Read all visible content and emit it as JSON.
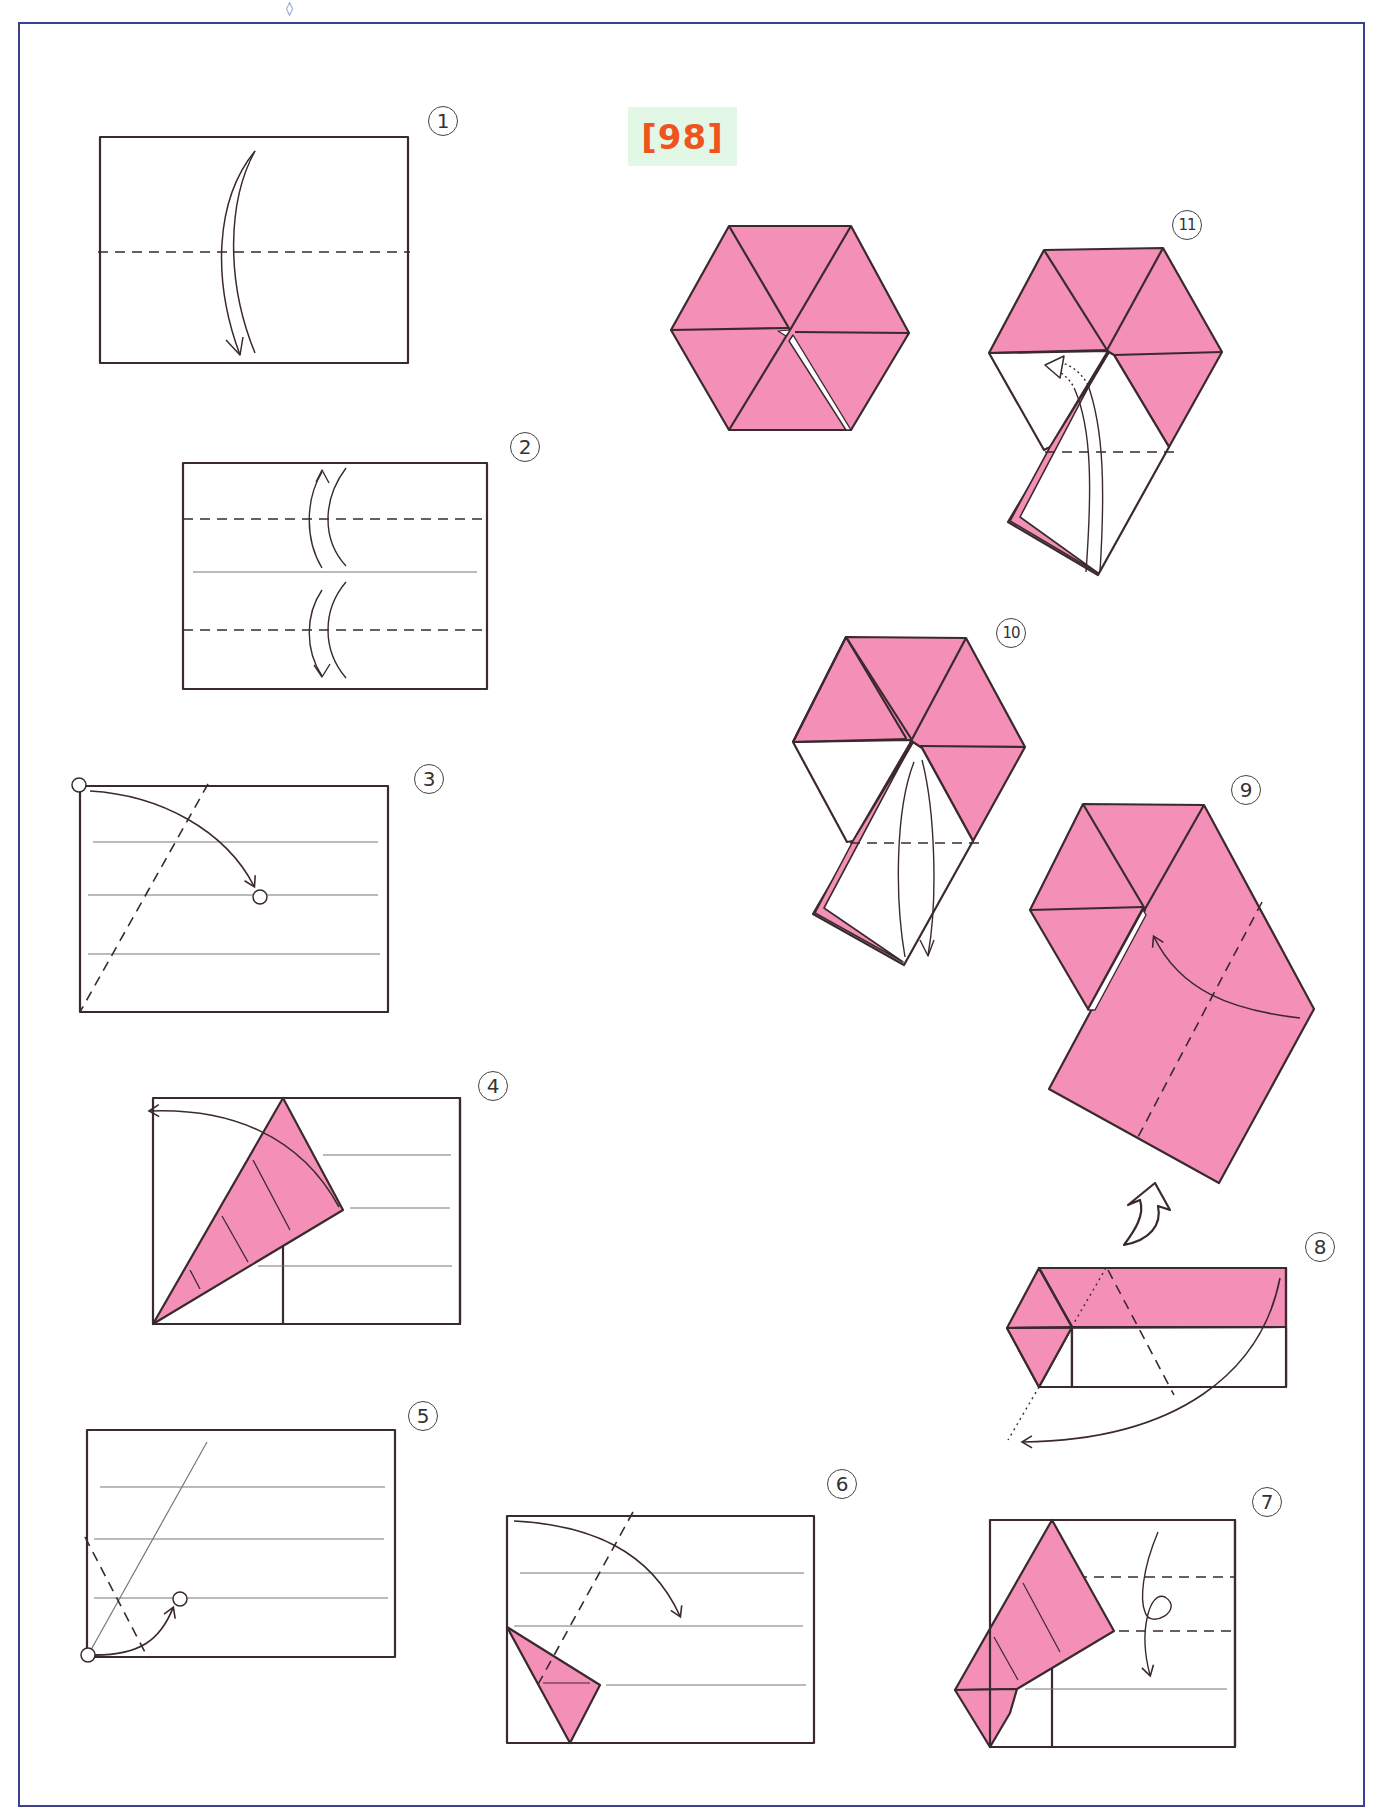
{
  "page": {
    "header_fragment": "y          g  p",
    "badge_label": "[98]",
    "colors": {
      "paper_pink": "#f48fb8",
      "line": "#3a2a2e",
      "frame_border": "#3d3f8f",
      "badge_bg": "#e3f7e6",
      "badge_text": "#f0541e"
    }
  },
  "steps": [
    {
      "number": "1",
      "label": "①",
      "description": "Valley fold rectangle in half horizontally"
    },
    {
      "number": "2",
      "label": "②",
      "description": "Fold top and bottom edges to center crease, unfold"
    },
    {
      "number": "3",
      "label": "③",
      "description": "Fold top-left corner to point on middle crease"
    },
    {
      "number": "4",
      "label": "④",
      "description": "Unfold the triangle flap"
    },
    {
      "number": "5",
      "label": "⑤",
      "description": "Fold bottom-left corner to marked point"
    },
    {
      "number": "6",
      "label": "⑥",
      "description": "Fold top-left corner down along diagonal"
    },
    {
      "number": "7",
      "label": "⑦",
      "description": "Valley folds along horizontal creases, turn over"
    },
    {
      "number": "8",
      "label": "⑧",
      "description": "Fold strip along diagonal"
    },
    {
      "number": "9",
      "label": "⑨",
      "description": "Fold flap along dashed line"
    },
    {
      "number": "10",
      "label": "⑩",
      "description": "Fold bottom flap up along dashed line"
    },
    {
      "number": "11",
      "label": "⑪",
      "description": "Tuck flap into pocket"
    }
  ],
  "result": {
    "label": "finished-hexagon",
    "segments": 6
  }
}
